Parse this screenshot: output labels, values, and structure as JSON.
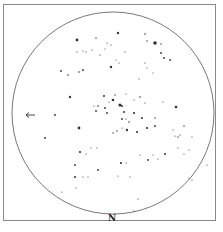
{
  "diagram": {
    "type": "star-chart",
    "direction_label": "N",
    "arrow": {
      "x": 31,
      "y": 115,
      "direction": "left"
    },
    "circle": {
      "cx": 113,
      "cy": 113,
      "r": 101,
      "stroke": "#555555"
    },
    "star_color": "#333333",
    "stars": [
      [
        77,
        40,
        1.4
      ],
      [
        96,
        38,
        0.7
      ],
      [
        107,
        43,
        0.6
      ],
      [
        111,
        45,
        0.6
      ],
      [
        118,
        33,
        1.2
      ],
      [
        145,
        34,
        0.8
      ],
      [
        147,
        41,
        0.7
      ],
      [
        155,
        43,
        1.8
      ],
      [
        161,
        44,
        0.7
      ],
      [
        161,
        53,
        0.9
      ],
      [
        77,
        52,
        0.6
      ],
      [
        83,
        51,
        0.6
      ],
      [
        86,
        52,
        0.6
      ],
      [
        92,
        50,
        0.6
      ],
      [
        105,
        49,
        0.6
      ],
      [
        100,
        55,
        0.6
      ],
      [
        125,
        52,
        0.6
      ],
      [
        164,
        58,
        0.9
      ],
      [
        170,
        60,
        0.9
      ],
      [
        61,
        71,
        0.9
      ],
      [
        68,
        75,
        0.8
      ],
      [
        79,
        72,
        0.8
      ],
      [
        83,
        70,
        0.9
      ],
      [
        111,
        67,
        1.2
      ],
      [
        116,
        60,
        0.6
      ],
      [
        119,
        63,
        0.6
      ],
      [
        145,
        63,
        0.6
      ],
      [
        147,
        68,
        0.6
      ],
      [
        153,
        73,
        0.6
      ],
      [
        139,
        79,
        0.6
      ],
      [
        70,
        97,
        1.2
      ],
      [
        94,
        106,
        0.6
      ],
      [
        98,
        106,
        0.8
      ],
      [
        96,
        111,
        0.9
      ],
      [
        105,
        108,
        0.9
      ],
      [
        107,
        113,
        0.9
      ],
      [
        109,
        102,
        0.6
      ],
      [
        104,
        96,
        1.0
      ],
      [
        113,
        100,
        1.3
      ],
      [
        115,
        95,
        0.7
      ],
      [
        122,
        106,
        1.0
      ],
      [
        124,
        112,
        1.0
      ],
      [
        120,
        105,
        1.6
      ],
      [
        126,
        94,
        0.6
      ],
      [
        134,
        100,
        0.6
      ],
      [
        140,
        97,
        0.8
      ],
      [
        145,
        103,
        0.6
      ],
      [
        134,
        113,
        1.1
      ],
      [
        142,
        118,
        1.0
      ],
      [
        155,
        118,
        0.7
      ],
      [
        163,
        102,
        0.6
      ],
      [
        176,
        107,
        1.3
      ],
      [
        55,
        115,
        0.9
      ],
      [
        45,
        138,
        0.9
      ],
      [
        79,
        128,
        1.4
      ],
      [
        113,
        133,
        0.7
      ],
      [
        117,
        131,
        0.7
      ],
      [
        122,
        119,
        0.9
      ],
      [
        126,
        119,
        0.6
      ],
      [
        129,
        122,
        0.8
      ],
      [
        122,
        128,
        0.6
      ],
      [
        127,
        130,
        1.2
      ],
      [
        137,
        132,
        1.1
      ],
      [
        147,
        128,
        1.1
      ],
      [
        155,
        126,
        0.9
      ],
      [
        173,
        130,
        0.6
      ],
      [
        175,
        136,
        0.6
      ],
      [
        178,
        137,
        0.7
      ],
      [
        180,
        135,
        0.6
      ],
      [
        184,
        126,
        0.7
      ],
      [
        192,
        137,
        0.6
      ],
      [
        80,
        152,
        1.1
      ],
      [
        86,
        154,
        0.6
      ],
      [
        91,
        148,
        0.6
      ],
      [
        97,
        148,
        0.6
      ],
      [
        75,
        165,
        0.9
      ],
      [
        75,
        177,
        1.0
      ],
      [
        83,
        177,
        0.6
      ],
      [
        88,
        177,
        0.6
      ],
      [
        98,
        170,
        0.9
      ],
      [
        118,
        176,
        0.6
      ],
      [
        130,
        177,
        0.6
      ],
      [
        121,
        163,
        1.1
      ],
      [
        126,
        163,
        0.6
      ],
      [
        140,
        155,
        0.6
      ],
      [
        148,
        160,
        0.9
      ],
      [
        153,
        155,
        0.6
      ],
      [
        158,
        159,
        0.6
      ],
      [
        165,
        154,
        1.0
      ],
      [
        178,
        148,
        0.6
      ],
      [
        184,
        154,
        0.6
      ],
      [
        189,
        150,
        0.6
      ],
      [
        62,
        192,
        0.6
      ],
      [
        76,
        188,
        0.6
      ],
      [
        138,
        199,
        0.6
      ],
      [
        134,
        211,
        0.6
      ],
      [
        189,
        178,
        0.6
      ],
      [
        192,
        180,
        0.6
      ],
      [
        207,
        165,
        0.6
      ]
    ]
  }
}
